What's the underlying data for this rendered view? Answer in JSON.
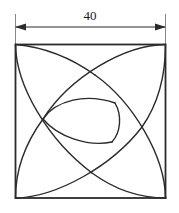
{
  "figure": {
    "dimension_label": "40",
    "units": "",
    "stroke_color": "#2b2b2b",
    "background_color": "#ffffff",
    "square": {
      "name": "outer-square",
      "side_label": "40",
      "left": 15,
      "top": 44,
      "right": 166,
      "bottom": 198,
      "stroke_width": 1.6
    },
    "dimension_line": {
      "name": "width-dimension",
      "label": "40",
      "y": 27,
      "x_start": 15,
      "x_end": 166,
      "arrow_left": "left-arrowhead",
      "arrow_right": "right-arrowhead",
      "extension_top": 14,
      "extension_bottom": 44
    },
    "junction_points": [
      {
        "name": "left-vertex",
        "x": 43,
        "y": 119
      },
      {
        "name": "upper-right-vertex",
        "x": 115,
        "y": 103
      },
      {
        "name": "lower-right-vertex",
        "x": 112,
        "y": 142
      },
      {
        "name": "top-crossing",
        "x": 95,
        "y": 75
      },
      {
        "name": "right-crossing",
        "x": 142,
        "y": 127
      },
      {
        "name": "bottom-crossing",
        "x": 92,
        "y": 173
      }
    ],
    "arcs": [
      {
        "name": "arc-from-top-left-corner",
        "start": [
          15,
          44
        ],
        "end": [
          92,
          173
        ]
      },
      {
        "name": "arc-from-top-right-corner",
        "start": [
          166,
          44
        ],
        "end": [
          43,
          119
        ]
      },
      {
        "name": "arc-from-bottom-right-corner",
        "start": [
          166,
          198
        ],
        "end": [
          95,
          75
        ]
      },
      {
        "name": "arc-from-bottom-left-corner",
        "start": [
          15,
          198
        ],
        "end": [
          142,
          127
        ]
      }
    ],
    "inner_triangle": {
      "name": "inner-curved-triangle",
      "vertices": [
        [
          43,
          119
        ],
        [
          115,
          103
        ],
        [
          112,
          142
        ]
      ]
    }
  }
}
